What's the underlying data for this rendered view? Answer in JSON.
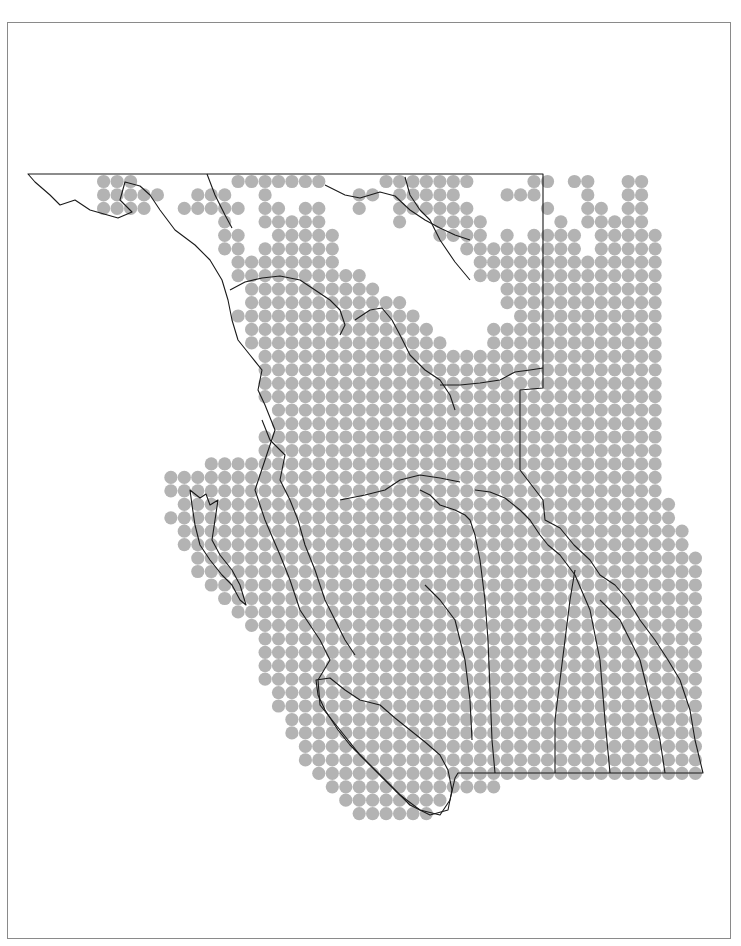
{
  "map": {
    "region": "British Columbia",
    "dot_color": "#b3b3b3",
    "line_color": "#1a1a1a",
    "frame_color": "#8a8a8a",
    "grid": {
      "origin_x": 63.3,
      "origin_y": 181.5,
      "spacing": 13.45,
      "dot_radius": 6.6,
      "rows": [
        "000111000000011111110000111111100001101100110000",
        "000111110011100100000011011111000111000100110000",
        "000111100111110110110010011111100000100110110000",
        "000000000000100111110000010011110000010111110000",
        "000000000000110011111000000011110101111011111000",
        "000000000000110111111000000000111111111011111000",
        "000000000000011111111000000000011111111111111000",
        "000000000000011111111110000000011111111111111000",
        "000000000000001111111111000000000111111111111000",
        "000000000000001111111111110000000111111111111000",
        "000000000000011111111111111000000011111111111000",
        "000000000000001111111111111100001111111111111000",
        "000000000000001111111111111110001111111111111000",
        "000000000000000111111111111111111111111111111000",
        "000000000000000111111111111111111111111111111000",
        "000000000000000111111111111111111111111111111000",
        "000000000000000111111111111111111111111111111000",
        "000000000000000011111111111111111111111111111000",
        "000000000000000011111111111111111111111111111000",
        "000000000000000111111111111111111111111111111000",
        "000000000000000111111111111111111111111111111000",
        "000000000001111111111111111111111111111111111000",
        "000000001111111111111111111111111111111111111000",
        "000000001111111111111111111111111111111111111000",
        "000000000111111111111111111111111111111111111100",
        "000000001111111111111111111111111111111111111100",
        "000000000111111111111111111111111111111111111110",
        "000000000111111111111111111111111111111111111110",
        "000000000011111111111111111111111111111111111111",
        "000000000011111111111111111111111111111111111111",
        "000000000001111111111111111111111111111111111111",
        "000000000000111111111111111111111111111111111111",
        "000000000000011111111111111111111111111111111111",
        "000000000000001111111111111111111111111111111111",
        "000000000000000111111111111111111111111111111111",
        "000000000000000111111111111111111111111111111111",
        "000000000000000111111111111111111111111111111111",
        "000000000000000111111111111111111111111111111111",
        "000000000000000011111111111111111111111111111111",
        "000000000000000011111111111111111111111111111111",
        "000000000000000001111111111111111111111111111111",
        "000000000000000001111111111111111111111111111111",
        "000000000000000000111111111111111111111111111111",
        "000000000000000000111111111111111111111111111111",
        "000000000000000000011111111111111111111111111111",
        "000000000000000000001111111111111000000000000000",
        "000000000000000000000111111110000000000000000000",
        "000000000000000000000011111100000000000000000000"
      ]
    }
  }
}
